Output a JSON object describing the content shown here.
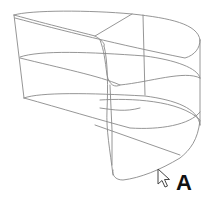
{
  "diagram": {
    "type": "3d-wireframe-surface",
    "label": "A",
    "stroke_color": "#8a8a8a",
    "background_color": "#ffffff",
    "pointer": "mouse-pointer-icon"
  }
}
